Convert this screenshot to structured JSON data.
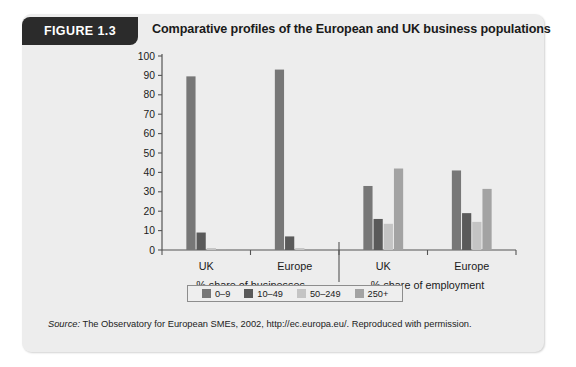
{
  "figure": {
    "tag": "FIGURE 1.3",
    "title": "Comparative profiles of the European and UK business populations"
  },
  "source": {
    "label": "Source:",
    "text": " The Observatory for European SMEs, 2002, http://ec.europa.eu/. Reproduced with permission."
  },
  "legend": {
    "items": [
      {
        "label": "0–9",
        "color": "#777777"
      },
      {
        "label": "10–49",
        "color": "#5a5a5a"
      },
      {
        "label": "50–249",
        "color": "#c4c4c4"
      },
      {
        "label": "250+",
        "color": "#a3a3a3"
      }
    ]
  },
  "chart_data": {
    "type": "bar",
    "title": "Comparative profiles of the European and UK business populations",
    "xlabel": "",
    "ylabel": "",
    "ylim": [
      0,
      100
    ],
    "yticks": [
      0,
      10,
      20,
      30,
      40,
      50,
      60,
      70,
      80,
      90,
      100
    ],
    "ytick_labels": [
      "0",
      "10",
      "20",
      "30",
      "40",
      "50",
      "60",
      "70",
      "80",
      "90",
      "100"
    ],
    "grid": false,
    "legend_position": "bottom",
    "panels": [
      {
        "axis_label": "% share of businesses",
        "categories": [
          "UK",
          "Europe"
        ]
      },
      {
        "axis_label": "% share of employment",
        "categories": [
          "UK",
          "Europe"
        ]
      }
    ],
    "categories": [
      "UK",
      "Europe",
      "UK",
      "Europe"
    ],
    "series": [
      {
        "name": "0–9",
        "color": "#777777",
        "values": [
          89.5,
          93.0,
          33.0,
          41.0
        ]
      },
      {
        "name": "10–49",
        "color": "#5a5a5a",
        "values": [
          9.0,
          7.0,
          16.0,
          19.0
        ]
      },
      {
        "name": "50–249",
        "color": "#c4c4c4",
        "values": [
          1.0,
          1.0,
          13.5,
          14.5
        ]
      },
      {
        "name": "250+",
        "color": "#a3a3a3",
        "values": [
          0.4,
          0.3,
          42.0,
          31.5
        ]
      }
    ]
  }
}
